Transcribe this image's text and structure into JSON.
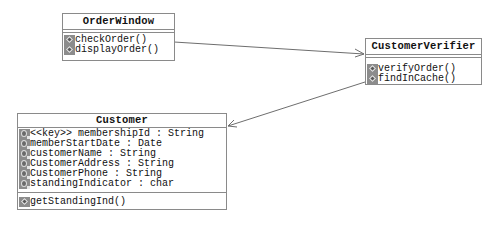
{
  "classes": {
    "order_window": {
      "name": "OrderWindow",
      "attributes": [],
      "methods": [
        "checkOrder()",
        "displayOrder()"
      ]
    },
    "customer_verifier": {
      "name": "CustomerVerifier",
      "attributes": [],
      "methods": [
        "verifyOrder()",
        "findInCache()"
      ]
    },
    "customer": {
      "name": "Customer",
      "attributes": [
        "<<key>> membershipId : String",
        "memberStartDate : Date",
        "customerName : String",
        "CustomerAddress : String",
        "CustomerPhone : String",
        "standingIndicator : char"
      ],
      "methods": [
        "getStandingInd()"
      ]
    }
  },
  "associations": [
    {
      "from": "OrderWindow",
      "to": "CustomerVerifier",
      "type": "directed-association"
    },
    {
      "from": "CustomerVerifier",
      "to": "Customer",
      "type": "directed-association"
    }
  ],
  "icons": {
    "method": "method-icon",
    "attribute": "attribute-icon"
  },
  "colors": {
    "border": "#8a8a8a",
    "icon_fill": "#8c8c8c",
    "line": "#6e6e6e"
  }
}
